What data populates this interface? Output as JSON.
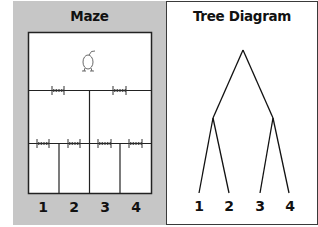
{
  "panels": {
    "maze": {
      "title": "Maze",
      "background": "#c6c6c6",
      "goal_labels": [
        "1",
        "2",
        "3",
        "4"
      ],
      "start_icon": "mouse-icon",
      "gate_icon": "spring-gate-icon"
    },
    "tree": {
      "title": "Tree Diagram",
      "leaf_labels": [
        "1",
        "2",
        "3",
        "4"
      ]
    }
  }
}
